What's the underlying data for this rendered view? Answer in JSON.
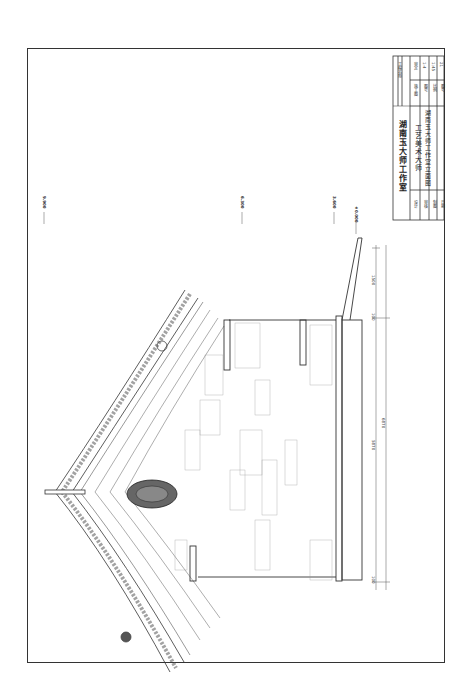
{
  "drawing": {
    "type": "architectural-elevation",
    "orientation": "rotated-90",
    "border_color": "#333333",
    "line_color": "#444444"
  },
  "title_block": {
    "company": "湖南玉大师工作室",
    "project_label": "工程名称",
    "project_value": "工艺美术大师",
    "drawing_title": "湖南玉大师工作室立面图",
    "drawing_no_label": "图号",
    "drawing_no": "1-4",
    "scale_label": "比例",
    "scale": "1:45",
    "sheet_label": "图号",
    "sheet": "21",
    "date_label": "日期",
    "design_label": "设计",
    "check_label": "审核",
    "draw_label": "制图",
    "approve_label": "审定",
    "phase_label": "阶段",
    "phase": "施工图",
    "edit_label": "修改",
    "sign_label": "签名"
  },
  "levels": [
    {
      "label": "±0.000",
      "id": "ground"
    },
    {
      "label": "3.600",
      "id": "eave"
    },
    {
      "label": "6.300",
      "id": "roof-base"
    },
    {
      "label": "9.900",
      "id": "ridge"
    }
  ],
  "dimensions": {
    "total": "6870",
    "main_span": "5870",
    "left_offset": "100",
    "right_offset": "100",
    "step": "1500"
  }
}
